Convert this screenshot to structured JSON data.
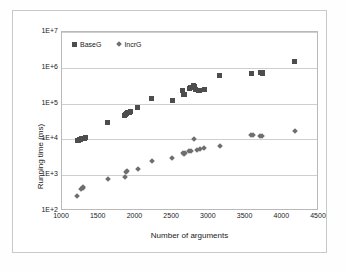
{
  "chart_data": {
    "type": "scatter",
    "title": "",
    "xlabel": "Number of arguments",
    "ylabel": "Running time (ms)",
    "xlim": [
      1000,
      4500
    ],
    "ylim": [
      100,
      10000000
    ],
    "yscale": "log",
    "xticks": [
      1000,
      1500,
      2000,
      2500,
      3000,
      3500,
      4000,
      4500
    ],
    "xtick_labels": [
      "1000",
      "1500",
      "2000",
      "2500",
      "3000",
      "3500",
      "4000",
      "4500"
    ],
    "yticks": [
      100,
      1000,
      10000,
      100000,
      1000000,
      10000000
    ],
    "ytick_labels": [
      "1E+2",
      "1E+3",
      "1E+4",
      "1E+5",
      "1E+6",
      "1E+7"
    ],
    "grid": "horizontal",
    "legend_position": "top-left-inside",
    "series": [
      {
        "name": "BaseG",
        "marker": "square",
        "color": "#4d4d4d",
        "points": [
          [
            1205,
            9300
          ],
          [
            1225,
            9600
          ],
          [
            1240,
            9900
          ],
          [
            1255,
            10200
          ],
          [
            1270,
            10400
          ],
          [
            1285,
            10600
          ],
          [
            1300,
            10800
          ],
          [
            1315,
            11000
          ],
          [
            1620,
            29000
          ],
          [
            1850,
            48000
          ],
          [
            1865,
            50000
          ],
          [
            1880,
            53000
          ],
          [
            1895,
            56000
          ],
          [
            1915,
            58000
          ],
          [
            1930,
            60000
          ],
          [
            2030,
            78000
          ],
          [
            2225,
            135000
          ],
          [
            2500,
            125000
          ],
          [
            2640,
            230000
          ],
          [
            2655,
            175000
          ],
          [
            2670,
            185000
          ],
          [
            2730,
            265000
          ],
          [
            2745,
            280000
          ],
          [
            2790,
            330000
          ],
          [
            2800,
            300000
          ],
          [
            2815,
            250000
          ],
          [
            2860,
            235000
          ],
          [
            2875,
            230000
          ],
          [
            2940,
            240000
          ],
          [
            3150,
            600000
          ],
          [
            3580,
            700000
          ],
          [
            3710,
            740000
          ],
          [
            3725,
            760000
          ],
          [
            3735,
            700000
          ],
          [
            4170,
            1500000
          ]
        ]
      },
      {
        "name": "IncrG",
        "marker": "diamond",
        "color": "#6e6e6e",
        "points": [
          [
            1205,
            260
          ],
          [
            1265,
            420
          ],
          [
            1280,
            450
          ],
          [
            1290,
            470
          ],
          [
            1620,
            760
          ],
          [
            1855,
            880
          ],
          [
            1875,
            1250
          ],
          [
            1885,
            1350
          ],
          [
            2035,
            1500
          ],
          [
            2225,
            2450
          ],
          [
            2500,
            3000
          ],
          [
            2645,
            4300
          ],
          [
            2660,
            4000
          ],
          [
            2675,
            4100
          ],
          [
            2730,
            4700
          ],
          [
            2750,
            4800
          ],
          [
            2800,
            10200
          ],
          [
            2845,
            5200
          ],
          [
            2875,
            5400
          ],
          [
            2940,
            5600
          ],
          [
            3150,
            6500
          ],
          [
            3580,
            13000
          ],
          [
            3600,
            13200
          ],
          [
            3700,
            12400
          ],
          [
            3720,
            12200
          ],
          [
            4170,
            17000
          ]
        ]
      }
    ]
  }
}
